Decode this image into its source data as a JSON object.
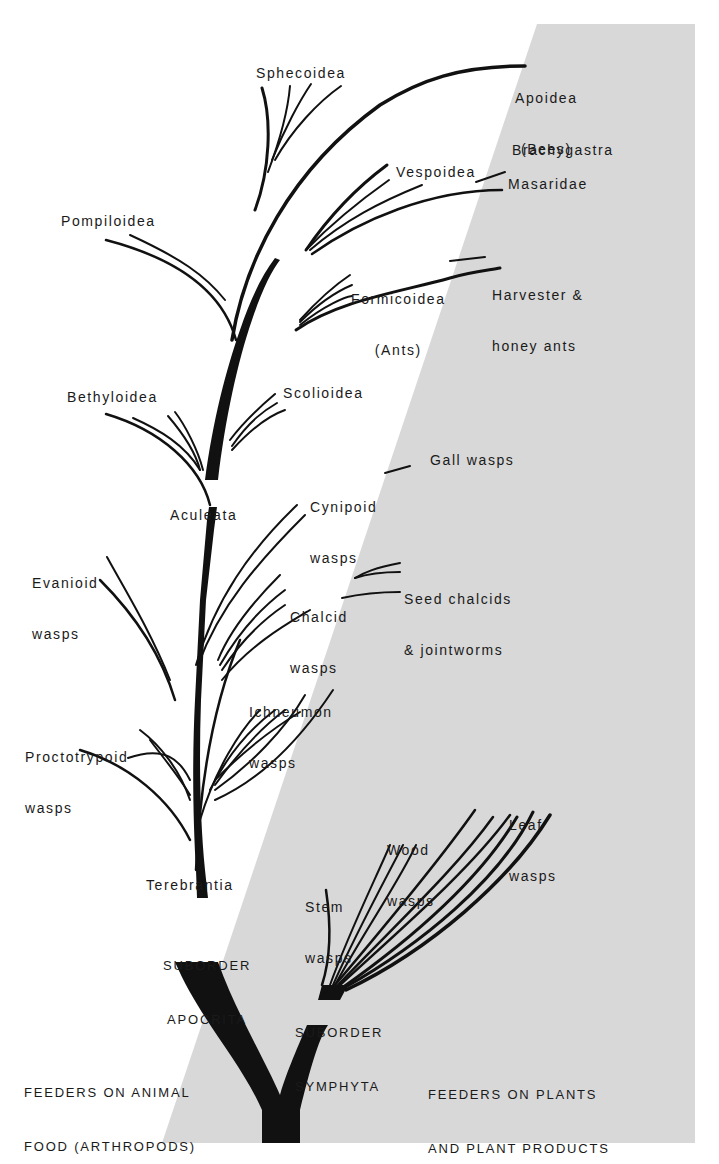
{
  "diagram": {
    "colors": {
      "background": "#ffffff",
      "plant_region": "#d8d8d8",
      "ink": "#111111"
    },
    "regions": {
      "animal_feeders": {
        "line1": "FEEDERS ON ANIMAL",
        "line2": "FOOD (ARTHROPODS)"
      },
      "plant_feeders": {
        "line1": "FEEDERS ON PLANTS",
        "line2": "AND PLANT PRODUCTS"
      }
    },
    "suborders": {
      "apocrita": {
        "line1": "SUBORDER",
        "line2": "APOCRITA"
      },
      "symphyta": {
        "line1": "SUBORDER",
        "line2": "SYMPHYTA"
      }
    },
    "groups": {
      "terebrantia": "Terebrantia",
      "aculeata": "Aculeata"
    },
    "taxa": {
      "apoidea": {
        "line1": "Apoidea",
        "line2": "(Bees)"
      },
      "sphecoidea": "Sphecoidea",
      "brachygastra": "Brachygastra",
      "vespoidea": "Vespoidea",
      "masaridae": "Masaridae",
      "pompiloidea": "Pompiloidea",
      "formicoidea": {
        "line1": "Formicoidea",
        "line2": "(Ants)"
      },
      "harvester": {
        "line1": "Harvester &",
        "line2": "honey ants"
      },
      "bethyloidea": "Bethyloidea",
      "scolioidea": "Scolioidea",
      "cynipoid": {
        "line1": "Cynipoid",
        "line2": "wasps"
      },
      "gall_wasps": "Gall wasps",
      "evanioid": {
        "line1": "Evanioid",
        "line2": "wasps"
      },
      "seed_chalcids": {
        "line1": "Seed chalcids",
        "line2": "& jointworms"
      },
      "chalcid": {
        "line1": "Chalcid",
        "line2": "wasps"
      },
      "ichneumon": {
        "line1": "Ichneumon",
        "line2": "wasps"
      },
      "proctotrypoid": {
        "line1": "Proctotrypoid",
        "line2": "wasps"
      },
      "wood_wasps": {
        "line1": "Wood",
        "line2": "wasps"
      },
      "leaf_wasps": {
        "line1": "Leaf",
        "line2": "wasps"
      },
      "stem_wasps": {
        "line1": "Stem",
        "line2": "wasps"
      }
    }
  }
}
